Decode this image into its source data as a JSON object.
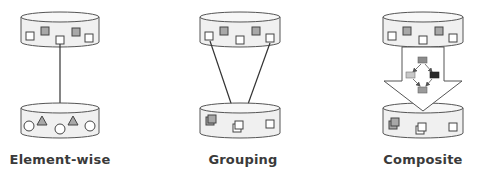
{
  "panels": [
    {
      "id": "element-wise",
      "label": "Element-wise",
      "input_items": [
        "white-square",
        "gray-square",
        "white-square",
        "gray-square",
        "white-square"
      ],
      "output_items": [
        "white-circle",
        "gray-triangle",
        "white-circle",
        "gray-triangle",
        "white-circle"
      ],
      "connection": "single arrow from one input element to one output element"
    },
    {
      "id": "grouping",
      "label": "Grouping",
      "input_items": [
        "white-square",
        "gray-square",
        "white-square",
        "gray-square",
        "white-square"
      ],
      "output_items": [
        "stacked-gray-squares",
        "stacked-white-squares",
        "white-square"
      ],
      "connection": "two arrows from two input elements converging to one grouped output"
    },
    {
      "id": "composite",
      "label": "Composite",
      "input_items": [
        "white-square",
        "gray-square",
        "white-square",
        "gray-square",
        "white-square"
      ],
      "output_items": [
        "stacked-gray-squares",
        "stacked-white-squares",
        "white-square"
      ],
      "connection": "large block arrow containing a small sub-pipeline graph"
    }
  ],
  "colors": {
    "stroke": "#444444",
    "cylinder_fill": "#f0f0f0",
    "item_gray": "#a8a8a8",
    "item_white": "#ffffff",
    "arrow_line": "#333333",
    "node_dark": "#2a2a2a",
    "node_mid": "#8c8c8c",
    "node_light": "#c8c8c8",
    "label": "#3a3a3a"
  }
}
